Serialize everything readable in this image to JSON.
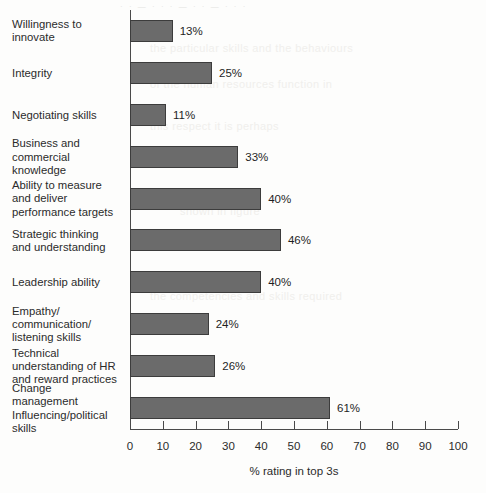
{
  "ghost": {
    "top_line": "· · — · · ·  — · ·  —  · · ·",
    "blocks": [
      {
        "text": "the particular skills and the behaviours",
        "x": 150,
        "y": 42
      },
      {
        "text": "of the human resources function in",
        "x": 150,
        "y": 78
      },
      {
        "text": "this respect it is perhaps",
        "x": 150,
        "y": 120
      },
      {
        "text": "shown in figure",
        "x": 180,
        "y": 205
      },
      {
        "text": "the competencies and skills required",
        "x": 150,
        "y": 290
      },
      {
        "text": "of leaders in organisations today",
        "x": 150,
        "y": 400
      }
    ]
  },
  "chart_data": {
    "type": "bar",
    "orientation": "horizontal",
    "title": "",
    "subtitle": "",
    "xlabel": "% rating in top 3s",
    "ylabel": "",
    "xlim": [
      0,
      100
    ],
    "xticks": [
      0,
      10,
      20,
      30,
      40,
      50,
      60,
      70,
      80,
      90,
      100
    ],
    "grid": false,
    "legend": null,
    "value_suffix": "%",
    "bar_color": "#6b6b6b",
    "bar_border_color": "#3c3c3c",
    "axis_color": "#4a4a4a",
    "text_color": "#2b2b2b",
    "categories": [
      "Willingness to\ninnovate",
      "Integrity",
      "Negotiating skills",
      "Business and\ncommercial\nknowledge",
      "Ability to measure\nand deliver\nperformance targets",
      "Strategic thinking\nand understanding",
      "Leadership ability",
      "Empathy/\ncommunication/\nlistening skills",
      "Technical\nunderstanding of HR\nand reward practices",
      "Change\nmanagement\nInfluencing/political\nskills"
    ],
    "values": [
      13,
      25,
      11,
      33,
      40,
      46,
      40,
      24,
      26,
      61
    ],
    "value_labels": [
      "13%",
      "25%",
      "11%",
      "33%",
      "40%",
      "46%",
      "40%",
      "24%",
      "26%",
      "61%"
    ],
    "tick_labels": [
      "0",
      "10",
      "20",
      "30",
      "40",
      "50",
      "60",
      "70",
      "80",
      "90",
      "100"
    ]
  }
}
